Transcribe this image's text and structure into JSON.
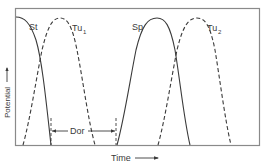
{
  "figure": {
    "x_axis_label": "Time",
    "y_axis_label": "Potential",
    "colors": {
      "line": "#3a3a3a",
      "frame": "#7a7a7a",
      "background": "#ffffff"
    },
    "curves": [
      {
        "id": "st",
        "label": "St",
        "style": "solid"
      },
      {
        "id": "tu1",
        "label": "Tu",
        "subscript": "1",
        "style": "dashed"
      },
      {
        "id": "sp",
        "label": "Sp",
        "style": "solid"
      },
      {
        "id": "tu2",
        "label": "Tu",
        "subscript": "2",
        "style": "dashed"
      }
    ],
    "interval": {
      "label": "Dor"
    }
  }
}
